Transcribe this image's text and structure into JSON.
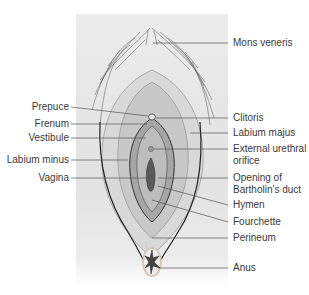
{
  "figure": {
    "type": "anatomical-diagram"
  },
  "labels": {
    "left": [
      {
        "id": "prepuce",
        "text": "Prepuce"
      },
      {
        "id": "frenum",
        "text": "Frenum"
      },
      {
        "id": "vestibule",
        "text": "Vestibule"
      },
      {
        "id": "labium_minus",
        "text": "Labium minus"
      },
      {
        "id": "vagina",
        "text": "Vagina"
      }
    ],
    "right": [
      {
        "id": "mons_veneris",
        "text": "Mons veneris"
      },
      {
        "id": "clitoris",
        "text": "Clitoris"
      },
      {
        "id": "labium_majus",
        "text": "Labium majus"
      },
      {
        "id": "external_urethral_orifice",
        "text": "External urethral",
        "text2": "orifice"
      },
      {
        "id": "opening_bartholins_duct",
        "text": "Opening of",
        "text2": "Bartholin's duct"
      },
      {
        "id": "hymen",
        "text": "Hymen"
      },
      {
        "id": "fourchette",
        "text": "Fourchette"
      },
      {
        "id": "perineum",
        "text": "Perineum"
      },
      {
        "id": "anus",
        "text": "Anus"
      }
    ]
  },
  "colors": {
    "label_text": "#3a3a3a",
    "leader_line": "#555555",
    "panel_bg": "#e6e6e6",
    "outline": "#222222",
    "tissue_dark": "#9a9a9a",
    "tissue_light": "#d4d4d4"
  }
}
